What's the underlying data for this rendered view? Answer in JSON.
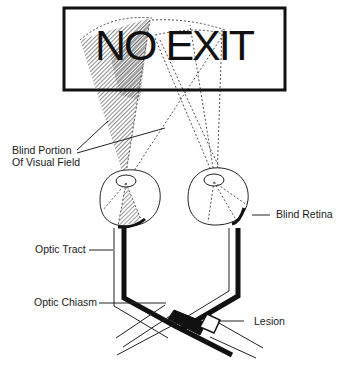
{
  "sign": {
    "text": "NO EXIT"
  },
  "labels": {
    "blind_portion_line1": "Blind Portion",
    "blind_portion_line2": "Of Visual Field",
    "blind_retina": "Blind Retina",
    "optic_tract": "Optic Tract",
    "optic_chiasm": "Optic Chiasm",
    "lesion": "Lesion"
  },
  "colors": {
    "ink": "#111111",
    "hatch": "#555555",
    "background": "#ffffff"
  }
}
